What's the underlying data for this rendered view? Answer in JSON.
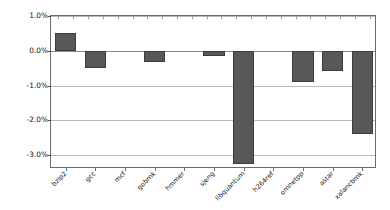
{
  "chart_data": {
    "type": "bar",
    "title": "",
    "subtitle": "",
    "xlabel": "",
    "ylabel": "Overhead(%)",
    "categories": [
      "bzip2",
      "gcc",
      "mcf",
      "gobmk",
      "hmmer",
      "sjeng",
      "libquantum",
      "h264ref",
      "omnetpp",
      "astar",
      "xalancbmk"
    ],
    "values": [
      0.5,
      -0.5,
      0.0,
      -0.33,
      0.0,
      -0.15,
      -3.25,
      0.0,
      -0.9,
      -0.58,
      -2.4
    ],
    "ylim": [
      -3.4,
      1.0
    ],
    "ytick_values": [
      1.0,
      0.0,
      -1.0,
      -2.0,
      -3.0
    ],
    "ytick_labels": [
      "1.0%",
      "0.0%",
      "-1.0%",
      "-2.0%",
      "-3.0%"
    ],
    "grid": true,
    "grid_axis": "y",
    "legend": false,
    "legend_position": "none",
    "bar_color": "#585858",
    "bar_edge_color": "#3d3d3d",
    "axis_color": "#6b6b6b",
    "grid_color": "#b9b9b9",
    "xtick_rotation": -45,
    "series": [
      {
        "name": "Overhead",
        "values": [
          0.5,
          -0.5,
          0.0,
          -0.33,
          0.0,
          -0.15,
          -3.25,
          0.0,
          -0.9,
          -0.58,
          -2.4
        ]
      }
    ]
  }
}
